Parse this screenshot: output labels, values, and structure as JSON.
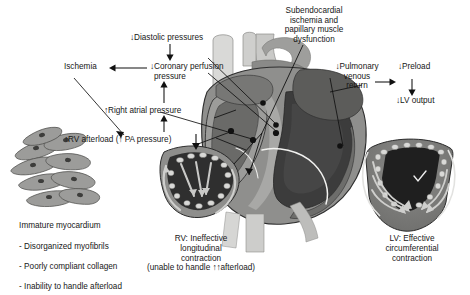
{
  "figure": {
    "background": "#ffffff",
    "text_color": "#171717"
  },
  "flow": {
    "diastolic_pressures": {
      "arrow": "↓",
      "text": "Diastolic pressures"
    },
    "coronary_perfusion": {
      "arrow": "↓",
      "line1": "Coronary perfusion",
      "line2": "pressure"
    },
    "ischemia": {
      "text": "Ischemia"
    },
    "right_atrial_pressure": {
      "arrow": "↑",
      "text": "Right atrial pressure"
    },
    "rv_afterload": {
      "arrow": "↑",
      "text": "RV afterload (",
      "arrow2": "↑",
      "text2": " PA pressure)"
    },
    "pulmonary_venous_return": {
      "arrow": "↓",
      "line1": "Pulmonary",
      "line2": "venous",
      "line3": "return"
    },
    "preload": {
      "arrow": "↓",
      "text": "Preload"
    },
    "lv_output": {
      "arrow": "↓",
      "text": "LV output"
    },
    "subendocardial": {
      "line1": "Subendocardial",
      "line2": "ischemia and",
      "line3": "papillary muscle",
      "line4": "dysfunction"
    }
  },
  "myocardium": {
    "title": "Immature myocardium",
    "bullets": [
      "- Disorganized myofibrils",
      "- Poorly compliant collagen",
      "- Inability to handle afterload"
    ]
  },
  "captions": {
    "rv": {
      "line1": "RV: Ineffective",
      "line2": "longitudinal",
      "line3": "contraction",
      "line4_pre": "(unable to handle ",
      "line4_arrow": "↑↑",
      "line4_post": "afterload)"
    },
    "lv": {
      "line1": "LV: Effective",
      "line2": "circumferential",
      "line3": "contraction"
    }
  },
  "colors": {
    "vessel_light": "#d8d8d6",
    "vessel_mid": "#b4b4b2",
    "myocardium_gray": "#8f8f8d",
    "chamber_dark": "#3a3a3a",
    "chamber_mid": "#616161",
    "cell_gray": "#9a9a98",
    "outline": "#2b2b2b",
    "arrow_light": "#d6d6d4"
  }
}
